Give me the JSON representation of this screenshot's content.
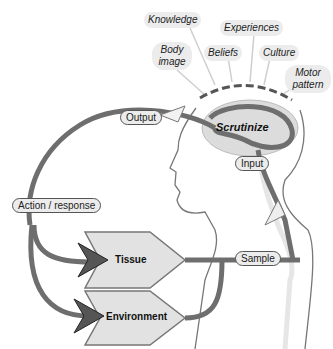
{
  "diagram": {
    "influences": [
      {
        "label": "Knowledge"
      },
      {
        "label": "Experiences"
      },
      {
        "label": "Body image"
      },
      {
        "label": "Beliefs"
      },
      {
        "label": "Culture"
      },
      {
        "label": "Motor pattern"
      }
    ],
    "influence_lines": {
      "body_image": "Body",
      "body_image_2": "image",
      "motor": "Motor",
      "motor_2": "pattern"
    },
    "center": {
      "label": "Scrutinize"
    },
    "pills": {
      "output": "Output",
      "input": "Input",
      "action": "Action / response",
      "sample": "Sample"
    },
    "boxes": {
      "tissue": "Tissue",
      "environment": "Environment"
    },
    "colors": {
      "pathway": "#6e6e6e",
      "box_fill": "#e2e2e2",
      "arrowhead": "#555555",
      "cloud_fill": "#ececec",
      "brain_fill": "#dcdcdc"
    }
  }
}
